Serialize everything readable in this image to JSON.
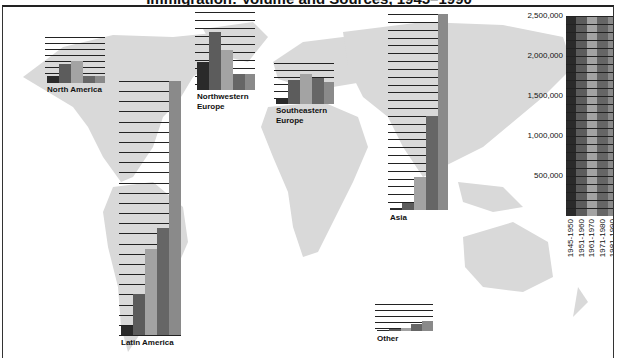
{
  "title": "Immigration: Volume and Sources, 1945–1990",
  "legend": {
    "periods": [
      "1945-1950",
      "1951-1960",
      "1961-1970",
      "1971-1980",
      "1981-1990"
    ],
    "colors": [
      "#2a2a2a",
      "#5c5c5c",
      "#a3a3a3",
      "#666666",
      "#8a8a8a"
    ],
    "ticks": [
      "2,500,000",
      "2,000,000",
      "1,500,000",
      "1,000,000",
      "500,000"
    ]
  },
  "regions": [
    {
      "name": "North America",
      "label": "North America"
    },
    {
      "name": "Latin America",
      "label": "Latin America"
    },
    {
      "name": "Northwestern Europe",
      "label": "Northwestern Europe"
    },
    {
      "name": "Southeastern Europe",
      "label": "Southeastern Europe"
    },
    {
      "name": "Asia",
      "label": "Asia"
    },
    {
      "name": "Other",
      "label": "Other"
    }
  ],
  "chart_data": {
    "type": "bar",
    "title": "Immigration: Volume and Sources, 1945–1990",
    "xlabel": "",
    "ylabel": "Number of immigrants",
    "ylim": [
      0,
      2500000
    ],
    "grid_step": 100000,
    "categories": [
      "North America",
      "Latin America",
      "Northwestern Europe",
      "Southeastern Europe",
      "Asia",
      "Other"
    ],
    "series": [
      {
        "name": "1945-1950",
        "values": [
          100000,
          90000,
          350000,
          50000,
          20000,
          10000
        ]
      },
      {
        "name": "1951-1960",
        "values": [
          290000,
          410000,
          700000,
          300000,
          90000,
          30000
        ]
      },
      {
        "name": "1961-1970",
        "values": [
          330000,
          850000,
          500000,
          400000,
          420000,
          50000
        ]
      },
      {
        "name": "1971-1980",
        "values": [
          100000,
          1060000,
          200000,
          340000,
          1200000,
          120000
        ]
      },
      {
        "name": "1981-1990",
        "values": [
          110000,
          2500000,
          200000,
          280000,
          2500000,
          180000
        ]
      }
    ],
    "legend_position": "right",
    "background": "world map"
  }
}
